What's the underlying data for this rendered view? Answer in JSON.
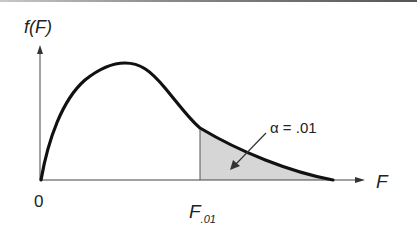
{
  "figure": {
    "y_axis_label": "f(F)",
    "x_axis_label": "F",
    "origin_label": "0",
    "critical_value_label": "F",
    "critical_value_subscript": ".01",
    "alpha_annotation": "α = .01"
  },
  "colors": {
    "curve": "#111111",
    "axis": "#333333",
    "shaded_region": "#d8d8d8"
  },
  "diagram_data": {
    "type": "probability-density-curve",
    "distribution": "F distribution (right-skewed)",
    "shaded_tail": "right tail beyond F.01",
    "tail_area": 0.01
  }
}
